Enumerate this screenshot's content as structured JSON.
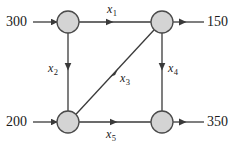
{
  "diagram": {
    "type": "network-flow",
    "background_color": "#ffffff",
    "node_fill_color": "#d4d4d4",
    "node_stroke_color": "#4a4a4a",
    "edge_color": "#3a3a3a",
    "text_color": "#1a1a1a",
    "nodes": [
      {
        "id": "n1",
        "name": "top-left-node",
        "cx": 68,
        "cy": 22,
        "r": 11
      },
      {
        "id": "n2",
        "name": "top-right-node",
        "cx": 162,
        "cy": 22,
        "r": 11
      },
      {
        "id": "n3",
        "name": "bottom-left-node",
        "cx": 68,
        "cy": 122,
        "r": 11
      },
      {
        "id": "n4",
        "name": "bottom-right-node",
        "cx": 162,
        "cy": 122,
        "r": 11
      }
    ],
    "external_flows": [
      {
        "id": "in-top",
        "label": "300",
        "direction": "inbound",
        "target_node": "n1"
      },
      {
        "id": "out-top",
        "label": "150",
        "direction": "outbound",
        "source_node": "n2"
      },
      {
        "id": "in-bottom",
        "label": "200",
        "direction": "inbound",
        "target_node": "n3"
      },
      {
        "id": "out-bottom",
        "label": "350",
        "direction": "outbound",
        "source_node": "n4"
      }
    ],
    "edges": [
      {
        "id": "e1",
        "label": "x",
        "subscript": "1",
        "from": "n1",
        "to": "n2",
        "orientation": "horizontal",
        "arrow_direction": "right"
      },
      {
        "id": "e2",
        "label": "x",
        "subscript": "2",
        "from": "n1",
        "to": "n3",
        "orientation": "vertical",
        "arrow_direction": "down"
      },
      {
        "id": "e3",
        "label": "x",
        "subscript": "3",
        "from": "n3",
        "to": "n2",
        "orientation": "diagonal",
        "arrow_direction": "up-right"
      },
      {
        "id": "e4",
        "label": "x",
        "subscript": "4",
        "from": "n2",
        "to": "n4",
        "orientation": "vertical",
        "arrow_direction": "down"
      },
      {
        "id": "e5",
        "label": "x",
        "subscript": "5",
        "from": "n3",
        "to": "n4",
        "orientation": "horizontal",
        "arrow_direction": "right"
      }
    ]
  }
}
